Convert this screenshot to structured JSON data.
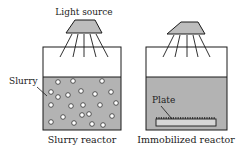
{
  "diagram": {
    "light_source_label": "Light source",
    "slurry_label": "Slurry",
    "plate_label": "Plate",
    "reactors": [
      {
        "name": "slurry-reactor",
        "caption": "Slurry reactor"
      },
      {
        "name": "immobilized-reactor",
        "caption": "Immobilized reactor"
      }
    ],
    "colors": {
      "liquid": "#b3b3b3",
      "lamp": "#bdbdbd",
      "stroke": "#1a1a1a",
      "particle": "#ffffff"
    }
  }
}
